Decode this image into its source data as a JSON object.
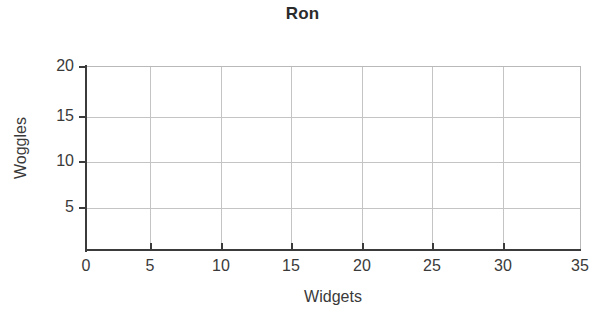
{
  "chart_data": {
    "type": "scatter",
    "title": "Ron",
    "xlabel": "Widgets",
    "ylabel": "Woggles",
    "xlim": [
      0,
      35
    ],
    "ylim": [
      0,
      20
    ],
    "xticks": [
      0,
      5,
      10,
      15,
      20,
      25,
      30,
      35
    ],
    "yticks": [
      0,
      5,
      10,
      15,
      20
    ],
    "xtick_labels": [
      "0",
      "5",
      "10",
      "15",
      "20",
      "25",
      "30",
      "35"
    ],
    "ytick_labels": [
      "5",
      "10",
      "15",
      "20"
    ],
    "grid": true,
    "legend": null,
    "series": [],
    "x": [],
    "y": [],
    "annotations": [],
    "note": "Empty plot: axes, gridlines and labels only; no data points are drawn."
  },
  "axes": {
    "y": {
      "ticks": [
        {
          "label": "20",
          "value": 20,
          "top": 58
        },
        {
          "label": "15",
          "value": 15,
          "top": 108
        },
        {
          "label": "10",
          "value": 10,
          "top": 153
        },
        {
          "label": "5",
          "value": 5,
          "top": 199
        }
      ],
      "gridlines": [
        117,
        162,
        208
      ]
    },
    "x": {
      "ticks": [
        {
          "label": "0",
          "value": 0,
          "left": 86
        },
        {
          "label": "5",
          "value": 5,
          "left": 150
        },
        {
          "label": "10",
          "value": 10,
          "left": 221
        },
        {
          "label": "15",
          "value": 15,
          "left": 291
        },
        {
          "label": "20",
          "value": 20,
          "left": 362
        },
        {
          "label": "25",
          "value": 25,
          "left": 432
        },
        {
          "label": "30",
          "value": 30,
          "left": 503
        },
        {
          "label": "35",
          "value": 35,
          "left": 580
        }
      ],
      "gridlines": [
        150,
        221,
        291,
        362,
        432,
        503
      ]
    }
  },
  "colors": {
    "background": "#ffffff",
    "axis": "#3b3b3b",
    "grid": "#c4c4c4",
    "spine_light": "#b9b9b9",
    "text": "#3a3a3a",
    "title": "#2b2b2b"
  }
}
